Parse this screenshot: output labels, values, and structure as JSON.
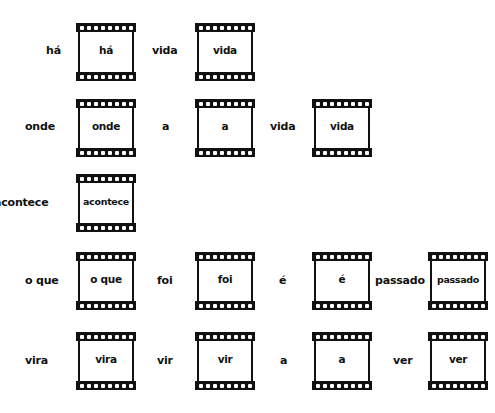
{
  "rows": [
    {
      "items": [
        {
          "kind": "word",
          "text": "há"
        },
        {
          "kind": "frame",
          "text": "há"
        },
        {
          "kind": "word",
          "text": "vida"
        },
        {
          "kind": "frame",
          "text": "vida"
        }
      ]
    },
    {
      "items": [
        {
          "kind": "word",
          "text": "onde"
        },
        {
          "kind": "frame",
          "text": "onde"
        },
        {
          "kind": "word",
          "text": "a"
        },
        {
          "kind": "frame",
          "text": "a"
        },
        {
          "kind": "word",
          "text": "vida"
        },
        {
          "kind": "frame",
          "text": "vida"
        }
      ]
    },
    {
      "items": [
        {
          "kind": "word",
          "text": "acontece"
        },
        {
          "kind": "frame",
          "text": "acontece"
        }
      ]
    },
    {
      "items": [
        {
          "kind": "word",
          "text": "o que"
        },
        {
          "kind": "frame",
          "text": "o que"
        },
        {
          "kind": "word",
          "text": "foi"
        },
        {
          "kind": "frame",
          "text": "foi"
        },
        {
          "kind": "word",
          "text": "é"
        },
        {
          "kind": "frame",
          "text": "é"
        },
        {
          "kind": "word",
          "text": "passado"
        },
        {
          "kind": "frame",
          "text": "passado"
        }
      ]
    },
    {
      "items": [
        {
          "kind": "word",
          "text": "vira"
        },
        {
          "kind": "frame",
          "text": "vira"
        },
        {
          "kind": "word",
          "text": "vir"
        },
        {
          "kind": "frame",
          "text": "vir"
        },
        {
          "kind": "word",
          "text": "a"
        },
        {
          "kind": "frame",
          "text": "a"
        },
        {
          "kind": "word",
          "text": "ver"
        },
        {
          "kind": "frame",
          "text": "ver"
        }
      ]
    }
  ],
  "icons": {
    "film_frame": "film-frame-icon"
  }
}
